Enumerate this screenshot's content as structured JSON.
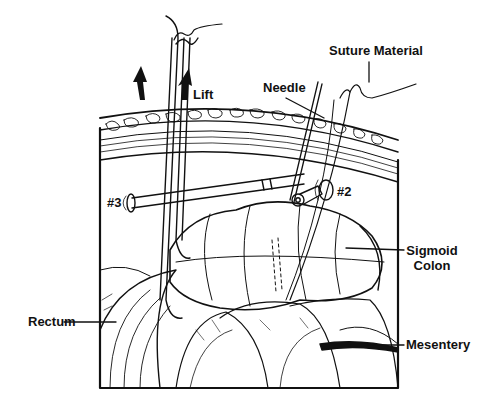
{
  "diagram": {
    "type": "medical-illustration",
    "labels": {
      "suture_material": "Suture Material",
      "needle": "Needle",
      "lift": "Lift",
      "port_3": "#3",
      "port_2": "#2",
      "sigmoid_colon_line1": "Sigmoid",
      "sigmoid_colon_line2": "Colon",
      "rectum": "Rectum",
      "mesentery": "Mesentery"
    },
    "colors": {
      "ink": "#111111",
      "background": "#ffffff"
    }
  }
}
